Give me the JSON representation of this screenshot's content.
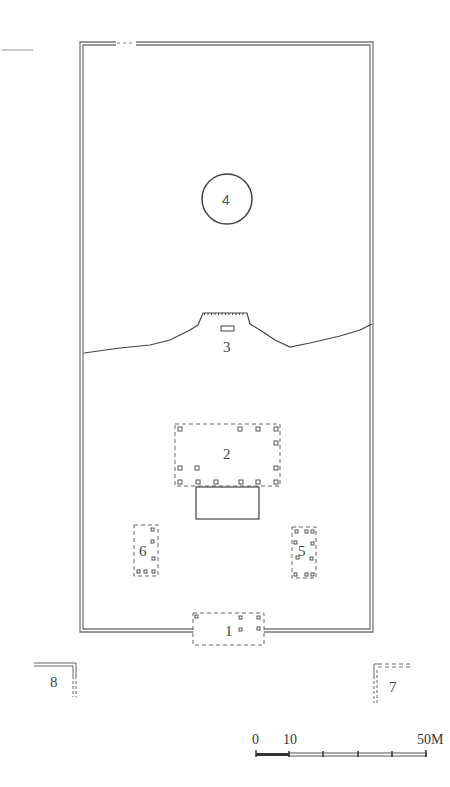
{
  "figure": {
    "type": "archaeological site plan",
    "labels": {
      "gate": "1",
      "main_hall": "2",
      "mound_platform": "3",
      "circular_feature": "4",
      "east_building": "5",
      "west_building": "6",
      "east_outer_structure": "7",
      "west_outer_structure": "8"
    },
    "scale_bar": {
      "ticks": [
        "0",
        "10",
        "50M"
      ],
      "unit": "M",
      "max": 50
    }
  }
}
